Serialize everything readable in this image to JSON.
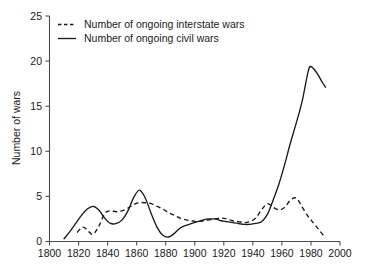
{
  "chart_data": {
    "type": "line",
    "title": "",
    "subtitle": "",
    "xlabel": "",
    "ylabel": "Number of wars",
    "xlim": [
      1800,
      2000
    ],
    "ylim": [
      0,
      25
    ],
    "xticks": [
      1800,
      1820,
      1840,
      1860,
      1880,
      1900,
      1920,
      1940,
      1960,
      1980,
      2000
    ],
    "yticks": [
      0,
      5,
      10,
      15,
      20,
      25
    ],
    "xtick_labels": [
      "1800",
      "1820",
      "1840",
      "1860",
      "1880",
      "1900",
      "1920",
      "1940",
      "1960",
      "1980",
      "2000"
    ],
    "ytick_labels": [
      "0",
      "5",
      "10",
      "15",
      "20",
      "25"
    ],
    "grid": false,
    "legend_position": "top-left",
    "series": [
      {
        "name": "Number of ongoing interstate wars",
        "style": "dashed",
        "color": "#1a1a1a",
        "x": [
          1819,
          1823,
          1827,
          1830,
          1834,
          1838,
          1842,
          1846,
          1850,
          1854,
          1858,
          1862,
          1866,
          1870,
          1874,
          1878,
          1882,
          1886,
          1890,
          1894,
          1898,
          1902,
          1906,
          1910,
          1914,
          1918,
          1922,
          1926,
          1930,
          1934,
          1938,
          1942,
          1946,
          1950,
          1954,
          1958,
          1962,
          1966,
          1970,
          1974,
          1978,
          1982,
          1986,
          1990
        ],
        "values": [
          1.0,
          1.6,
          1.1,
          0.8,
          1.7,
          3.1,
          3.4,
          3.3,
          3.4,
          3.7,
          4.1,
          4.3,
          4.3,
          4.2,
          3.9,
          3.6,
          3.2,
          2.9,
          2.6,
          2.4,
          2.3,
          2.2,
          2.3,
          2.4,
          2.5,
          2.6,
          2.5,
          2.3,
          2.2,
          2.1,
          2.2,
          2.6,
          3.5,
          4.2,
          3.8,
          3.5,
          3.8,
          4.6,
          4.8,
          3.8,
          2.8,
          2.0,
          1.2,
          0.4
        ]
      },
      {
        "name": "Number of ongoing civil wars",
        "style": "solid",
        "color": "#1a1a1a",
        "x": [
          1810,
          1814,
          1818,
          1822,
          1826,
          1830,
          1834,
          1838,
          1842,
          1846,
          1850,
          1854,
          1858,
          1862,
          1866,
          1870,
          1874,
          1878,
          1882,
          1886,
          1890,
          1894,
          1898,
          1902,
          1906,
          1910,
          1914,
          1918,
          1922,
          1926,
          1930,
          1934,
          1938,
          1942,
          1946,
          1950,
          1954,
          1958,
          1962,
          1966,
          1970,
          1974,
          1978,
          1980,
          1984,
          1988,
          1990
        ],
        "values": [
          0.3,
          1.1,
          2.0,
          2.9,
          3.6,
          3.9,
          3.5,
          2.6,
          2.0,
          2.0,
          2.4,
          3.4,
          4.9,
          5.7,
          4.8,
          3.1,
          1.6,
          0.7,
          0.5,
          0.9,
          1.5,
          1.8,
          2.0,
          2.2,
          2.4,
          2.5,
          2.5,
          2.3,
          2.2,
          2.1,
          2.0,
          1.9,
          1.9,
          2.0,
          2.2,
          3.0,
          4.6,
          6.4,
          8.6,
          11.0,
          13.2,
          15.6,
          18.8,
          19.4,
          18.7,
          17.6,
          17.1
        ]
      }
    ],
    "annotations": [
      {
        "text": "solid line peak",
        "x": 1980,
        "y": 19.4
      },
      {
        "text": "dashed line peak",
        "x": 1968,
        "y": 4.9
      }
    ]
  },
  "legend": {
    "items": [
      {
        "label": "Number of ongoing interstate wars",
        "style": "dashed"
      },
      {
        "label": "Number of ongoing civil wars",
        "style": "solid"
      }
    ]
  },
  "axes": {
    "y_title": "Number of wars"
  }
}
